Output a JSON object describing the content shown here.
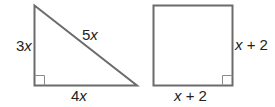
{
  "triangle": {
    "legs": {
      "vertical": "3x",
      "horizontal": "4x"
    },
    "hypotenuse": "5x",
    "right_angle_marker": true,
    "labels": [
      {
        "coef": "3",
        "var": "x"
      },
      {
        "coef": "5",
        "var": "x"
      },
      {
        "coef": "4",
        "var": "x"
      }
    ]
  },
  "square": {
    "side_right": {
      "var": "x",
      "rest": " + 2"
    },
    "side_bottom": {
      "var": "x",
      "rest": " + 2"
    },
    "right_angle_marker": true
  },
  "colors": {
    "stroke": "#6b6b6b",
    "text": "#222222"
  }
}
